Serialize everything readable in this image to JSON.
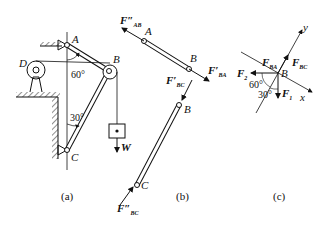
{
  "figure": {
    "panel_a": {
      "caption": "(a)",
      "points": {
        "A": "A",
        "B": "B",
        "C": "C",
        "D": "D"
      },
      "angles": {
        "top": "60°",
        "bottom": "30°"
      },
      "weight": "W"
    },
    "panel_b": {
      "caption": "(b)",
      "points": {
        "A": "A",
        "B1": "B",
        "B2": "B",
        "C": "C"
      },
      "forces": {
        "F_AB_pp": {
          "main": "F″",
          "sub": "AB"
        },
        "F_BA_p": {
          "main": "F′",
          "sub": "BA"
        },
        "F_BC_p": {
          "main": "F′",
          "sub": "BC"
        },
        "F_BC_pp": {
          "main": "F″",
          "sub": "BC"
        }
      }
    },
    "panel_c": {
      "caption": "(c)",
      "point": "B",
      "axes": {
        "x": "x",
        "y": "y"
      },
      "forces": {
        "F_BA": {
          "main": "F",
          "sub": "BA"
        },
        "F_BC": {
          "main": "F",
          "sub": "BC"
        },
        "F1": {
          "main": "F",
          "sub": "1"
        },
        "F2": {
          "main": "F",
          "sub": "2"
        }
      },
      "angles": {
        "a1": "60°",
        "a2": "30°"
      }
    }
  }
}
